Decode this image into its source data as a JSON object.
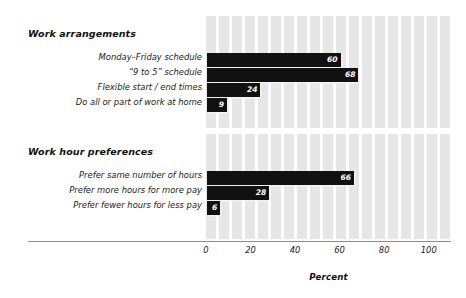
{
  "chart_data": {
    "type": "bar",
    "orientation": "horizontal",
    "title": "",
    "xlabel": "Percent",
    "ylabel": "",
    "xlim": [
      0,
      110
    ],
    "xticks": [
      0,
      20,
      40,
      60,
      80,
      100
    ],
    "xtick_labels": [
      "0",
      "20",
      "40",
      "60",
      "80",
      "100"
    ],
    "grid": "vertical-stripes",
    "legend": "none",
    "bar_color": "#111111",
    "value_label_color": "#ffffff",
    "panel_stripe_color": "#e6e6e6",
    "groups": [
      {
        "heading": "Work arrangements",
        "categories": [
          "Monday–Friday schedule",
          "“9 to 5” schedule",
          "Flexible start / end times",
          "Do all or part of work at home"
        ],
        "values": [
          60,
          68,
          24,
          9
        ],
        "value_labels": [
          "60",
          "68",
          "24",
          "9"
        ]
      },
      {
        "heading": "Work hour preferences",
        "categories": [
          "Prefer same number of hours",
          "Prefer more hours for more pay",
          "Prefer fewer hours for less pay"
        ],
        "values": [
          66,
          28,
          6
        ],
        "value_labels": [
          "66",
          "28",
          "6"
        ]
      }
    ]
  }
}
